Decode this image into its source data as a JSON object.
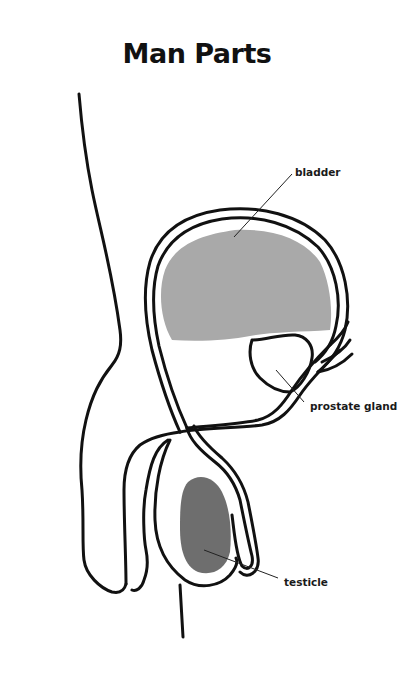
{
  "title": "Man Parts",
  "labels": {
    "bladder": "bladder",
    "prostate": "prostate gland",
    "testicle": "testicle"
  },
  "colors": {
    "outline": "#111111",
    "bladder_fill": "#a9a9a9",
    "testicle_fill": "#6e6e6e",
    "background": "#ffffff"
  }
}
